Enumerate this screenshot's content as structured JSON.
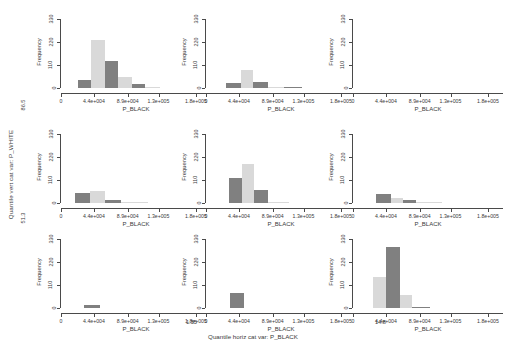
{
  "figure": {
    "outer_y_axis_label": "Quantile vert cat var: P_WHITE",
    "outer_y_ticks": [
      "86.5",
      "51.3"
    ],
    "outer_x_axis_label": "Quantile horiz cat var: P_BLACK",
    "outer_x_ticks": [
      "1.55",
      "14.8"
    ]
  },
  "panel_common": {
    "xlabel": "P_BLACK",
    "ylabel": "Frequency",
    "ytick_labels": [
      "0",
      "110",
      "220",
      "330"
    ],
    "ytick_values": [
      0,
      110,
      220,
      330
    ],
    "xtick_labels": [
      "0",
      "4.4e+004",
      "8.9e+004",
      "1.3e+005",
      "1.8e+005"
    ],
    "xtick_values": [
      0,
      44000,
      89000,
      130000,
      180000
    ],
    "ylim": [
      0,
      345
    ],
    "xlim": [
      0,
      200000
    ]
  },
  "colors": {
    "bar_dark": "#808080",
    "bar_light": "#d9d9d9",
    "axis": "#4a4a4a",
    "text": "#3a3a3a",
    "background": "#ffffff"
  },
  "chart_data": {
    "type": "bar",
    "title": "",
    "subtitle": "",
    "xlabel": "P_BLACK",
    "ylabel": "Frequency",
    "layout": "3x3 trellis / lattice conditioned histogram matrix",
    "grid": false,
    "legend": "none",
    "xlim": [
      0,
      200000
    ],
    "ylim": [
      0,
      345
    ],
    "xticks": [
      0,
      44000,
      89000,
      130000,
      180000
    ],
    "xticklabels": [
      "0",
      "4.4e+004",
      "8.9e+004",
      "1.3e+005",
      "1.8e+005"
    ],
    "yticks": [
      0,
      110,
      220,
      330
    ],
    "yticklabels": [
      "0",
      "110",
      "220",
      "330"
    ],
    "conditioning": {
      "rows_variable": "Quantile vert cat var: P_WHITE",
      "rows_ticks": [
        "86.5",
        "51.3"
      ],
      "cols_variable": "Quantile horiz cat var: P_BLACK",
      "cols_ticks": [
        "1.55",
        "14.8"
      ]
    },
    "panels": [
      {
        "row": 0,
        "col": 0,
        "name": "panel-r1c1",
        "bins": [
          {
            "x0": 22000,
            "x1": 40000,
            "value": 38,
            "shade": "dark"
          },
          {
            "x0": 40000,
            "x1": 58000,
            "value": 232,
            "shade": "light"
          },
          {
            "x0": 58000,
            "x1": 76000,
            "value": 131,
            "shade": "dark"
          },
          {
            "x0": 76000,
            "x1": 94000,
            "value": 52,
            "shade": "light"
          },
          {
            "x0": 94000,
            "x1": 112000,
            "value": 17,
            "shade": "dark"
          },
          {
            "x0": 112000,
            "x1": 132000,
            "value": 3,
            "shade": "light"
          }
        ]
      },
      {
        "row": 0,
        "col": 1,
        "name": "panel-r1c2",
        "bins": [
          {
            "x0": 26000,
            "x1": 46000,
            "value": 24,
            "shade": "dark"
          },
          {
            "x0": 46000,
            "x1": 62000,
            "value": 88,
            "shade": "light"
          },
          {
            "x0": 62000,
            "x1": 82000,
            "value": 30,
            "shade": "dark"
          },
          {
            "x0": 82000,
            "x1": 104000,
            "value": 6,
            "shade": "light"
          },
          {
            "x0": 104000,
            "x1": 128000,
            "value": 3,
            "shade": "dark"
          }
        ]
      },
      {
        "row": 0,
        "col": 2,
        "name": "panel-r1c3",
        "bins": []
      },
      {
        "row": 1,
        "col": 0,
        "name": "panel-r2c1",
        "bins": [
          {
            "x0": 18000,
            "x1": 38000,
            "value": 46,
            "shade": "dark"
          },
          {
            "x0": 38000,
            "x1": 58000,
            "value": 56,
            "shade": "light"
          },
          {
            "x0": 58000,
            "x1": 80000,
            "value": 14,
            "shade": "dark"
          },
          {
            "x0": 80000,
            "x1": 116000,
            "value": 4,
            "shade": "light"
          }
        ]
      },
      {
        "row": 1,
        "col": 1,
        "name": "panel-r2c2",
        "bins": [
          {
            "x0": 30000,
            "x1": 48000,
            "value": 122,
            "shade": "dark"
          },
          {
            "x0": 48000,
            "x1": 64000,
            "value": 185,
            "shade": "light"
          },
          {
            "x0": 64000,
            "x1": 82000,
            "value": 62,
            "shade": "dark"
          },
          {
            "x0": 82000,
            "x1": 110000,
            "value": 5,
            "shade": "light"
          }
        ]
      },
      {
        "row": 1,
        "col": 2,
        "name": "panel-r2c3",
        "bins": [
          {
            "x0": 30000,
            "x1": 50000,
            "value": 42,
            "shade": "dark"
          },
          {
            "x0": 50000,
            "x1": 66000,
            "value": 24,
            "shade": "light"
          },
          {
            "x0": 66000,
            "x1": 84000,
            "value": 13,
            "shade": "dark"
          },
          {
            "x0": 84000,
            "x1": 118000,
            "value": 3,
            "shade": "light"
          }
        ]
      },
      {
        "row": 2,
        "col": 0,
        "name": "panel-r3c1",
        "bins": [
          {
            "x0": 30000,
            "x1": 52000,
            "value": 16,
            "shade": "dark"
          }
        ]
      },
      {
        "row": 2,
        "col": 1,
        "name": "panel-r3c2",
        "bins": [
          {
            "x0": 32000,
            "x1": 50000,
            "value": 72,
            "shade": "dark"
          }
        ]
      },
      {
        "row": 2,
        "col": 2,
        "name": "panel-r3c3",
        "bins": [
          {
            "x0": 26000,
            "x1": 44000,
            "value": 150,
            "shade": "light"
          },
          {
            "x0": 44000,
            "x1": 62000,
            "value": 290,
            "shade": "dark"
          },
          {
            "x0": 62000,
            "x1": 78000,
            "value": 62,
            "shade": "light"
          },
          {
            "x0": 78000,
            "x1": 102000,
            "value": 6,
            "shade": "dark"
          }
        ]
      }
    ]
  }
}
